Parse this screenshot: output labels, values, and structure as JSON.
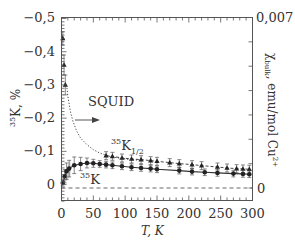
{
  "chart_data": {
    "type": "scatter",
    "title": "",
    "xlabel": "T, K",
    "ylabel_left": "35K, %",
    "ylabel_left_sup": "35",
    "ylabel_left_main": "K, %",
    "ylabel_right": "χbulk, emu/mol Cu2+",
    "ylabel_right_parts": {
      "chi": "χ",
      "sub": "bulk",
      "rest": ", emu/mol Cu",
      "sup": "2+"
    },
    "xlim": [
      0,
      300
    ],
    "ylim_left": [
      0.048,
      -0.503
    ],
    "ylim_right": [
      0,
      0.007
    ],
    "left_y_inverted": true,
    "x_ticks": [
      0,
      50,
      100,
      150,
      200,
      250,
      300
    ],
    "x_tick_labels": [
      "0",
      "50",
      "100",
      "150",
      "200",
      "250",
      "300"
    ],
    "y_left_ticks": [
      0,
      -0.1,
      -0.2,
      -0.3,
      -0.4,
      -0.5
    ],
    "y_left_tick_labels": [
      "0",
      "−0,1",
      "−0,2",
      "−0,3",
      "−0,4",
      "−0,5"
    ],
    "y_right_tick_labels": [
      "0",
      "0,007"
    ],
    "grid": false,
    "series": [
      {
        "name": "35K1/2",
        "marker": "triangle",
        "line": "dashed",
        "x": [
          2,
          4,
          6,
          70,
          80,
          95,
          110,
          125,
          140,
          150,
          170,
          185,
          205,
          220,
          245,
          260,
          275,
          285,
          295
        ],
        "y": [
          -0.44,
          -0.36,
          -0.3,
          -0.087,
          -0.085,
          -0.08,
          -0.077,
          -0.075,
          -0.072,
          -0.07,
          -0.066,
          -0.063,
          -0.06,
          -0.057,
          -0.053,
          -0.05,
          -0.048,
          -0.047,
          -0.046
        ],
        "err": [
          0.02,
          0.03,
          0.03,
          0.012,
          0.012,
          0.012,
          0.012,
          0.012,
          0.012,
          0.012,
          0.012,
          0.012,
          0.012,
          0.012,
          0.012,
          0.012,
          0.012,
          0.012,
          0.012
        ]
      },
      {
        "name": "35K",
        "marker": "circle",
        "line": "solid",
        "x": [
          2,
          5,
          8,
          12,
          20,
          30,
          40,
          50,
          60,
          70,
          80,
          95,
          110,
          125,
          140,
          150,
          185,
          205,
          225,
          245,
          270,
          285,
          295
        ],
        "y": [
          -0.005,
          -0.025,
          -0.04,
          -0.048,
          -0.058,
          -0.062,
          -0.065,
          -0.064,
          -0.062,
          -0.06,
          -0.058,
          -0.055,
          -0.052,
          -0.05,
          -0.048,
          -0.046,
          -0.042,
          -0.039,
          -0.037,
          -0.035,
          -0.033,
          -0.032,
          -0.031
        ],
        "err": [
          0.01,
          0.02,
          0.025,
          0.025,
          0.025,
          0.02,
          0.015,
          0.012,
          0.01,
          0.01,
          0.01,
          0.01,
          0.01,
          0.01,
          0.01,
          0.01,
          0.01,
          0.01,
          0.01,
          0.01,
          0.01,
          0.01,
          0.01
        ]
      },
      {
        "name": "SQUID",
        "marker": "none",
        "line": "dotted",
        "x": [
          8,
          10,
          14,
          18,
          24,
          30,
          40,
          50,
          60,
          75,
          90,
          110,
          130
        ],
        "y": [
          -0.3,
          -0.265,
          -0.22,
          -0.19,
          -0.16,
          -0.14,
          -0.12,
          -0.105,
          -0.095,
          -0.085,
          -0.08,
          -0.075,
          -0.072
        ]
      }
    ],
    "reference_lines": [
      {
        "name": "zero-chi-baseline",
        "y_right": 0,
        "style": "dashed"
      }
    ],
    "annotations": [
      {
        "text": "SQUID",
        "x": 18,
        "y": -0.235,
        "arrow": true
      },
      {
        "text_main": "K",
        "text_sup": "35",
        "text_sub": "1/2",
        "x": 90,
        "y": -0.105
      },
      {
        "text_main": "K",
        "text_sup": "35",
        "x": 40,
        "y": -0.015
      }
    ]
  }
}
